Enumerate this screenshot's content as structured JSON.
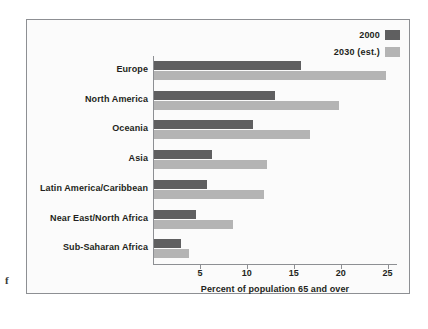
{
  "margin_glyph": "f",
  "legend": {
    "position": "top-right",
    "entries": [
      {
        "label": "2000",
        "color": "#5f5f60",
        "icon": "legend-swatch"
      },
      {
        "label": "2030 (est.)",
        "color": "#b4b4b4",
        "icon": "legend-swatch"
      }
    ]
  },
  "chart_data": {
    "type": "bar",
    "orientation": "horizontal",
    "title": "",
    "subtitle": "",
    "xlabel": "Percent of population 65 and over",
    "ylabel": "",
    "xlim": [
      0,
      26
    ],
    "xticks": [
      5,
      10,
      15,
      20,
      25
    ],
    "xtick_labels": [
      "5",
      "10",
      "15",
      "20",
      "25"
    ],
    "grid": false,
    "legend_position": "top-right",
    "categories": [
      "Europe",
      "North America",
      "Oceania",
      "Asia",
      "Latin America/Caribbean",
      "Near East/North Africa",
      "Sub-Saharan Africa"
    ],
    "series": [
      {
        "name": "2000",
        "color": "#5f5f60",
        "values": [
          15.7,
          12.9,
          10.6,
          6.2,
          5.7,
          4.5,
          2.9
        ]
      },
      {
        "name": "2030 (est.)",
        "color": "#b4b4b4",
        "values": [
          24.7,
          19.7,
          16.6,
          12.0,
          11.7,
          8.4,
          3.7
        ]
      }
    ]
  }
}
